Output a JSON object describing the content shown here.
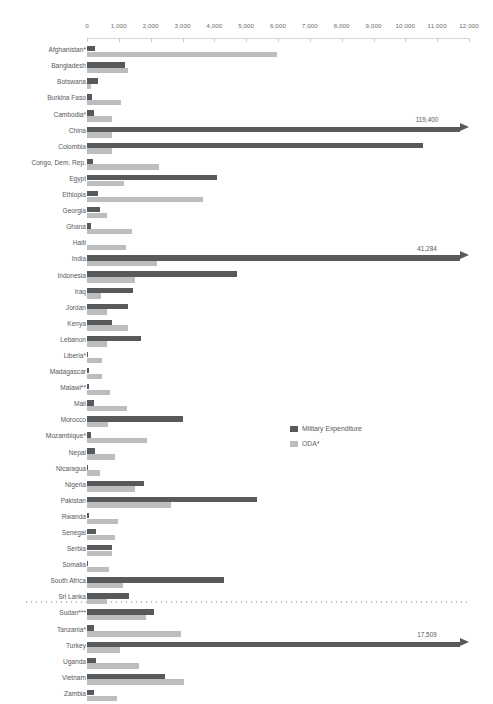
{
  "chart_data": {
    "type": "bar",
    "orientation": "horizontal",
    "title": "",
    "subtitle": "",
    "xlabel": "",
    "ylabel": "",
    "xlim": [
      0,
      12000
    ],
    "grid": false,
    "legend_position": "inside-right",
    "axis": {
      "ticks": [
        0,
        1000,
        2000,
        3000,
        4000,
        5000,
        6000,
        7000,
        8000,
        9000,
        10000,
        11000,
        12000
      ],
      "tick_labels": [
        "0",
        "1,000",
        "2,000",
        "3,000",
        "4,000",
        "5,000",
        "6,000",
        "7,000",
        "8,000",
        "9,000",
        "10,000",
        "11,000",
        "12,000"
      ]
    },
    "legend": [
      {
        "name": "Military Expenditure",
        "color": "#58595b"
      },
      {
        "name": "ODA*",
        "color": "#bcbdbf"
      }
    ],
    "categories": [
      "Afghanistan*",
      "Bangladesh",
      "Botswana",
      "Burkina Faso",
      "Cambodia*",
      "China",
      "Colombia",
      "Congo, Dem. Rep.",
      "Egypt",
      "Ethiopia",
      "Georgia",
      "Ghana",
      "Haiti",
      "India",
      "Indonesia",
      "Iraq",
      "Jordan",
      "Kenya",
      "Lebanon",
      "Liberia*",
      "Madagascar",
      "Malawi**",
      "Mali",
      "Morocco",
      "Mozambique*",
      "Nepal",
      "Nicaragua",
      "Nigeria",
      "Pakistan",
      "Rwanda",
      "Senegal",
      "Serbia",
      "Somalia",
      "South Africa",
      "Sri Lanka",
      "Sudan***",
      "Tanzania*",
      "Turkey",
      "Uganda",
      "Vietnam",
      "Zambia"
    ],
    "series": [
      {
        "name": "Military Expenditure",
        "color": "#58595b",
        "values": [
          250,
          1190,
          360,
          150,
          210,
          119400,
          10550,
          200,
          4080,
          330,
          410,
          120,
          0,
          41284,
          4700,
          1430,
          1290,
          790,
          1700,
          45,
          70,
          60,
          215,
          3000,
          130,
          240,
          30,
          1790,
          5350,
          70,
          270,
          800,
          20,
          4300,
          1330,
          2090,
          220,
          17509,
          290,
          2450,
          230
        ]
      },
      {
        "name": "ODA*",
        "color": "#bcbdbf",
        "values": [
          5970,
          1290,
          120,
          1060,
          770,
          780,
          770,
          2260,
          1150,
          3640,
          630,
          1400,
          1210,
          2210,
          1520,
          450,
          640,
          1280,
          630,
          470,
          480,
          710,
          1270,
          670,
          1900,
          870,
          420,
          1520,
          2630,
          980,
          890,
          780,
          680,
          1140,
          620,
          1850,
          2940,
          1050,
          1630,
          3040,
          940
        ]
      }
    ],
    "overflow_annotations": [
      {
        "category": "China",
        "value": 119400,
        "label": "119,400"
      },
      {
        "category": "India",
        "value": 41284,
        "label": "41,284"
      },
      {
        "category": "Turkey",
        "value": 17509,
        "label": "17,509"
      }
    ]
  }
}
